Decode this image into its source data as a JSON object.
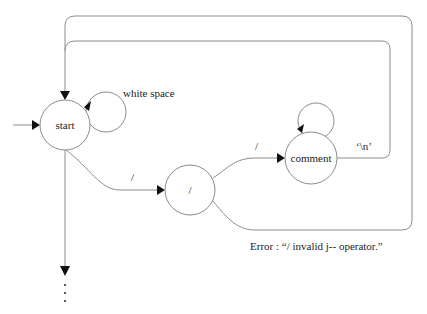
{
  "diagram": {
    "type": "state-machine",
    "nodes": [
      {
        "id": "start",
        "label": "start"
      },
      {
        "id": "slash",
        "label": "/"
      },
      {
        "id": "comment",
        "label": "comment"
      }
    ],
    "edges": [
      {
        "from": "entry",
        "to": "start",
        "label": ""
      },
      {
        "from": "start",
        "to": "start",
        "label": "white space"
      },
      {
        "from": "start",
        "to": "slash",
        "label": "/"
      },
      {
        "from": "slash",
        "to": "comment",
        "label": "/"
      },
      {
        "from": "comment",
        "to": "comment",
        "label": ""
      },
      {
        "from": "comment",
        "to": "start",
        "label": "'\\n'"
      },
      {
        "from": "slash",
        "to": "start",
        "label": ""
      },
      {
        "from": "start",
        "to": "continuation",
        "label": ""
      }
    ],
    "labels": {
      "white_space": "white space",
      "start_to_slash": "/",
      "slash_to_comment": "/",
      "newline": "‘\\n’",
      "error": "Error : “/ invalid j-- operator.”",
      "continuation": "⋮"
    }
  },
  "colors": {
    "line": "#8c8c8c",
    "arrow": "#111111",
    "text": "#222222",
    "background": "#ffffff"
  }
}
